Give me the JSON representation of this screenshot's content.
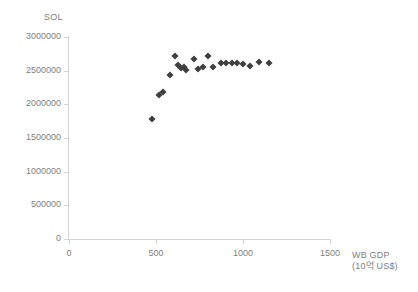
{
  "chart_data": {
    "type": "scatter",
    "title": "",
    "subtitle": "",
    "ylabel": "SOL",
    "xlabel": "WB GDP",
    "xlabel_unit": "(10억 US$)",
    "xlim": [
      0,
      1500
    ],
    "ylim": [
      0,
      3000000
    ],
    "xticks": [
      0,
      500,
      1000,
      1500
    ],
    "yticks": [
      0,
      500000,
      1000000,
      1500000,
      2000000,
      2500000,
      3000000
    ],
    "xtick_labels": [
      "0",
      "500",
      "1000",
      "1500"
    ],
    "ytick_labels": [
      "0",
      "500000",
      "1000000",
      "1500000",
      "2000000",
      "2500000",
      "3000000"
    ],
    "grid": false,
    "legend": false,
    "marker": "diamond",
    "marker_color": "#3f3f3f",
    "axis_color": "#d4d4d4",
    "series": [
      {
        "name": "SOL vs WB GDP",
        "points": [
          [
            478,
            1785000
          ],
          [
            515,
            2135000
          ],
          [
            543,
            2190000
          ],
          [
            578,
            2440000
          ],
          [
            612,
            2720000
          ],
          [
            628,
            2580000
          ],
          [
            645,
            2545000
          ],
          [
            662,
            2550000
          ],
          [
            672,
            2510000
          ],
          [
            718,
            2680000
          ],
          [
            740,
            2520000
          ],
          [
            772,
            2555000
          ],
          [
            800,
            2715000
          ],
          [
            828,
            2560000
          ],
          [
            872,
            2610000
          ],
          [
            905,
            2620000
          ],
          [
            935,
            2615000
          ],
          [
            968,
            2620000
          ],
          [
            1000,
            2605000
          ],
          [
            1040,
            2565000
          ],
          [
            1090,
            2625000
          ],
          [
            1148,
            2620000
          ]
        ]
      }
    ]
  }
}
